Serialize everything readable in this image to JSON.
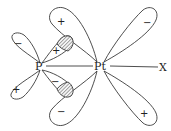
{
  "diagram": {
    "type": "orbital-overlap",
    "atoms": {
      "p": "P",
      "pt": "Pt",
      "x": "X"
    },
    "signs": {
      "p_upper_left": "−",
      "p_lower_left": "+",
      "p_upper_right": "+",
      "p_lower_right": "−",
      "pt_upper_left": "+",
      "pt_lower_left": "−",
      "pt_upper_right": "−",
      "pt_lower_right": "+"
    },
    "colors": {
      "stroke": "#3a3a3a",
      "background": "#ffffff"
    }
  }
}
